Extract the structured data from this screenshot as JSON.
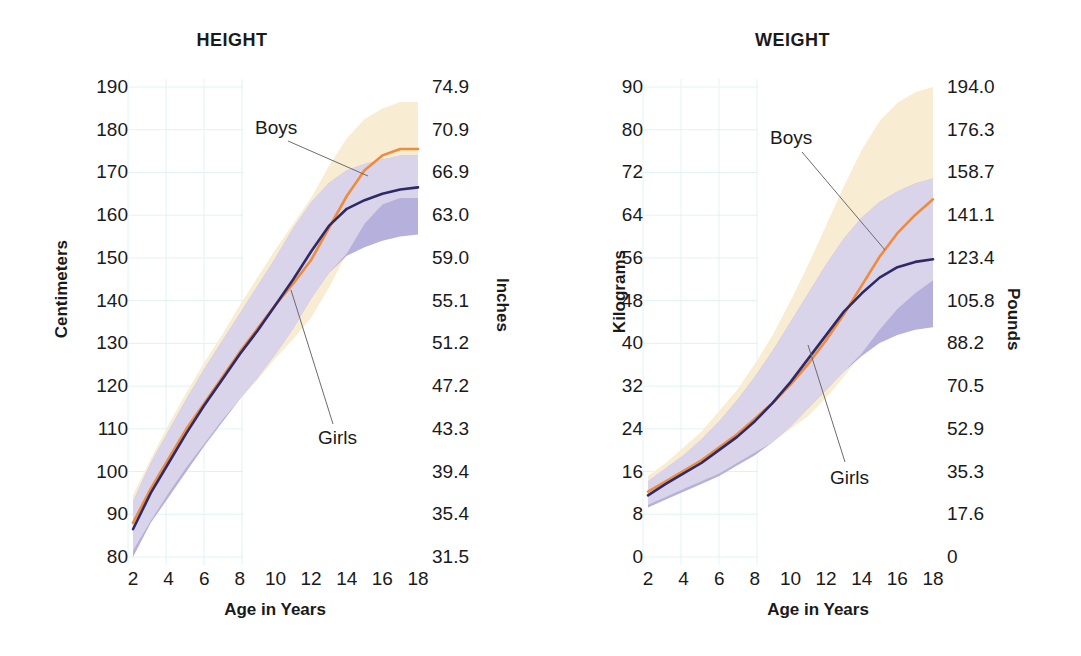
{
  "figure": {
    "background": "#ffffff",
    "boys_color": "#ef8b3c",
    "girls_color": "#2e2a68",
    "boys_band_color": "#f8edd2",
    "girls_band_color": "#a9a2d6",
    "mid_band_color": "#ddd7ec",
    "grid_color": "#e2f2f4",
    "leader_color": "#6b6b6b"
  },
  "charts": [
    {
      "id": "height",
      "title": "HEIGHT",
      "xlabel": "Age in Years",
      "ylabel_left": "Centimeters",
      "ylabel_right": "Inches",
      "boys_label": "Boys",
      "girls_label": "Girls",
      "xticks": [
        "2",
        "4",
        "6",
        "8",
        "10",
        "12",
        "14",
        "16",
        "18"
      ],
      "yticks_left": [
        "190",
        "180",
        "170",
        "160",
        "150",
        "140",
        "130",
        "120",
        "110",
        "100",
        "90",
        "80"
      ],
      "yticks_right": [
        "74.9",
        "70.9",
        "66.9",
        "63.0",
        "59.0",
        "55.1",
        "51.2",
        "47.2",
        "43.3",
        "39.4",
        "35.4",
        "31.5"
      ]
    },
    {
      "id": "weight",
      "title": "WEIGHT",
      "xlabel": "Age in Years",
      "ylabel_left": "Kilograms",
      "ylabel_right": "Pounds",
      "boys_label": "Boys",
      "girls_label": "Girls",
      "xticks": [
        "2",
        "4",
        "6",
        "8",
        "10",
        "12",
        "14",
        "16",
        "18"
      ],
      "yticks_left": [
        "90",
        "80",
        "72",
        "64",
        "56",
        "48",
        "40",
        "32",
        "24",
        "16",
        "8",
        "0"
      ],
      "yticks_right": [
        "194.0",
        "176.3",
        "158.7",
        "141.1",
        "123.4",
        "105.8",
        "88.2",
        "70.5",
        "52.9",
        "35.3",
        "17.6",
        "0"
      ]
    }
  ],
  "chart_data": [
    {
      "type": "line",
      "id": "height",
      "title": "HEIGHT",
      "xlabel": "Age in Years",
      "ylabel": "Centimeters",
      "ylabel_secondary": "Inches",
      "x": [
        2,
        3,
        4,
        5,
        6,
        7,
        8,
        9,
        10,
        11,
        12,
        13,
        14,
        15,
        16,
        17,
        18
      ],
      "xlim": [
        2,
        18
      ],
      "ylim": [
        80,
        190
      ],
      "ylim_secondary": [
        31.5,
        74.9
      ],
      "grid": true,
      "legend": "inline-annotations",
      "series": [
        {
          "name": "Boys",
          "color": "#ef8b3c",
          "values": [
            88.0,
            96.0,
            103.0,
            110.0,
            116.0,
            122.0,
            128.0,
            133.5,
            139.0,
            144.0,
            149.5,
            157.0,
            164.5,
            170.5,
            174.0,
            175.5,
            175.5
          ],
          "band_color": "#f8edd2",
          "band_lower": [
            81.5,
            88.5,
            95.0,
            101.0,
            106.5,
            112.0,
            117.0,
            121.5,
            126.5,
            131.0,
            136.0,
            143.0,
            151.0,
            158.0,
            162.5,
            164.0,
            164.0
          ],
          "band_upper": [
            94.5,
            103.0,
            111.0,
            118.5,
            125.5,
            132.0,
            139.0,
            145.5,
            152.0,
            158.0,
            164.0,
            171.5,
            178.0,
            182.5,
            185.0,
            186.5,
            186.5
          ]
        },
        {
          "name": "Girls",
          "color": "#2e2a68",
          "values": [
            86.5,
            95.0,
            102.0,
            109.0,
            115.5,
            121.5,
            127.5,
            133.0,
            139.0,
            145.0,
            151.5,
            157.5,
            161.5,
            163.5,
            165.0,
            166.0,
            166.5
          ],
          "band_color": "#a9a2d6",
          "band_lower": [
            80.0,
            88.0,
            94.0,
            100.0,
            106.0,
            111.5,
            117.0,
            122.0,
            127.5,
            133.5,
            140.5,
            146.5,
            150.5,
            152.5,
            154.0,
            155.0,
            155.5
          ],
          "band_upper": [
            93.0,
            102.0,
            109.5,
            117.0,
            124.0,
            130.5,
            137.0,
            143.5,
            150.0,
            157.0,
            163.0,
            167.5,
            170.5,
            172.0,
            173.0,
            174.0,
            174.0
          ]
        }
      ]
    },
    {
      "type": "line",
      "id": "weight",
      "title": "WEIGHT",
      "xlabel": "Age in Years",
      "ylabel": "Kilograms",
      "ylabel_secondary": "Pounds",
      "x": [
        2,
        3,
        4,
        5,
        6,
        7,
        8,
        9,
        10,
        11,
        12,
        13,
        14,
        15,
        16,
        17,
        18
      ],
      "xlim": [
        2,
        18
      ],
      "ylim": [
        0,
        90
      ],
      "ylim_secondary": [
        0,
        194.0
      ],
      "grid": true,
      "legend": "inline-annotations",
      "series": [
        {
          "name": "Boys",
          "color": "#ef8b3c",
          "values": [
            12.5,
            14.5,
            16.5,
            18.5,
            21.0,
            23.5,
            26.5,
            29.5,
            33.0,
            37.0,
            41.5,
            46.5,
            52.0,
            57.5,
            62.0,
            65.5,
            68.5
          ],
          "band_color": "#f8edd2",
          "band_lower": [
            10.0,
            11.5,
            13.0,
            14.5,
            16.0,
            18.0,
            20.0,
            22.0,
            24.5,
            27.0,
            30.5,
            34.5,
            39.0,
            43.5,
            47.5,
            50.5,
            53.0
          ],
          "band_upper": [
            15.5,
            18.0,
            21.0,
            24.0,
            28.0,
            32.0,
            37.0,
            42.5,
            49.0,
            56.0,
            63.5,
            71.0,
            78.0,
            83.5,
            87.0,
            89.0,
            90.0
          ]
        },
        {
          "name": "Girls",
          "color": "#2e2a68",
          "values": [
            11.8,
            14.0,
            16.0,
            18.0,
            20.5,
            23.0,
            26.0,
            29.5,
            33.5,
            38.0,
            42.5,
            47.0,
            50.5,
            53.5,
            55.5,
            56.5,
            57.0
          ],
          "band_color": "#a9a2d6",
          "band_lower": [
            9.5,
            11.0,
            12.5,
            14.0,
            15.5,
            17.5,
            19.5,
            22.0,
            25.0,
            28.5,
            32.0,
            35.5,
            38.5,
            41.0,
            42.5,
            43.5,
            44.0
          ],
          "band_upper": [
            14.5,
            17.0,
            19.5,
            22.5,
            26.0,
            30.0,
            34.5,
            39.5,
            45.0,
            50.5,
            56.0,
            61.0,
            65.0,
            68.0,
            70.0,
            71.5,
            72.5
          ]
        }
      ]
    }
  ]
}
